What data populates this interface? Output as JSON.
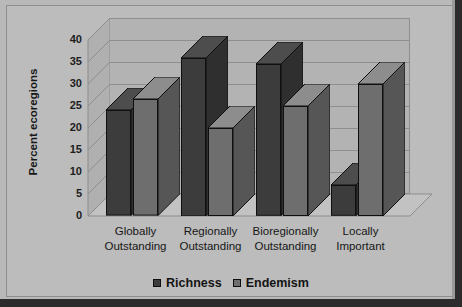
{
  "chart_data": {
    "type": "bar",
    "title": "",
    "xlabel": "",
    "ylabel": "Percent ecoregions",
    "ylim": [
      0,
      40
    ],
    "ytick_step": 5,
    "yticks": [
      "40",
      "35",
      "30",
      "25",
      "20",
      "15",
      "10",
      "5",
      "0"
    ],
    "grid": true,
    "legend_position": "bottom",
    "style": "3d-grouped-bar",
    "categories": [
      "Globally Outstanding",
      "Regionally Outstanding",
      "Bioregionally Outstanding",
      "Locally Important"
    ],
    "category_lines": [
      [
        "Globally",
        "Outstanding"
      ],
      [
        "Regionally",
        "Outstanding"
      ],
      [
        "Bioregionally",
        "Outstanding"
      ],
      [
        "Locally",
        "Important"
      ]
    ],
    "series": [
      {
        "name": "Richness",
        "color": "#3c3c3c",
        "values": [
          24,
          36,
          34.5,
          7
        ]
      },
      {
        "name": "Endemism",
        "color": "#6e6e6e",
        "values": [
          26.5,
          20,
          25,
          30
        ]
      }
    ]
  },
  "colors": {
    "figure_background": "#b9b9b9",
    "plot_background": "#b3b3b3",
    "gridline": "#8f8f8f",
    "frame": "#2c2c2c",
    "axis_text": "#1d1d1d",
    "richness": "#3c3c3c",
    "endemism": "#6e6e6e"
  },
  "legend": {
    "items": [
      {
        "label": "Richness",
        "marker": "square-dark"
      },
      {
        "label": "Endemism",
        "marker": "square-medium"
      }
    ]
  }
}
